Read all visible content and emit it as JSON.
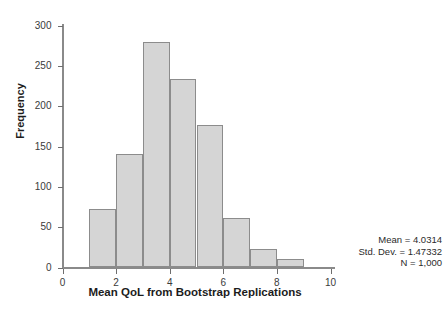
{
  "chart_data": {
    "type": "bar",
    "title": "",
    "subtitle": "",
    "xlabel": "Mean QoL from Bootstrap Replications",
    "ylabel": "Frequency",
    "xlim": [
      0,
      10
    ],
    "ylim": [
      0,
      300
    ],
    "grid": false,
    "legend": null,
    "bin_width": 1,
    "categories": [
      "1-2",
      "2-3",
      "3-4",
      "4-5",
      "5-6",
      "6-7",
      "7-8",
      "8-9"
    ],
    "bin_starts": [
      1,
      2,
      3,
      4,
      5,
      6,
      7,
      8
    ],
    "bin_ends": [
      2,
      3,
      4,
      5,
      6,
      7,
      8,
      9
    ],
    "values": [
      73,
      141,
      279,
      234,
      177,
      61,
      23,
      10
    ],
    "x_ticks": [
      0,
      2,
      4,
      6,
      8,
      10
    ],
    "x_tick_labels": [
      "0",
      "2",
      "4",
      "6",
      "8",
      "10"
    ],
    "y_ticks": [
      0,
      50,
      100,
      150,
      200,
      250,
      300
    ],
    "y_tick_labels": [
      "0",
      "50",
      "100",
      "150",
      "200",
      "250",
      "300"
    ],
    "bar_fill_color": "#d5d5d5",
    "bar_border_color": "#8c8c8c",
    "axis_color": "#8a8a8a",
    "annotations": [
      "Mean = 4.0314",
      "Std. Dev. = 1.47332",
      "N = 1,000"
    ]
  },
  "stats": {
    "mean": "Mean = 4.0314",
    "std_dev": "Std. Dev. = 1.47332",
    "n": "N = 1,000"
  }
}
